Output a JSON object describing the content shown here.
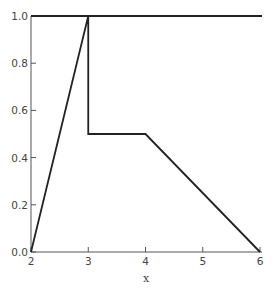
{
  "chart_data": {
    "type": "line",
    "title": "",
    "xlabel": "x",
    "ylabel": "",
    "xlim": [
      2,
      6
    ],
    "ylim": [
      0,
      1
    ],
    "grid": false,
    "legend": null,
    "x_ticks": [
      "2",
      "3",
      "4",
      "5",
      "6"
    ],
    "y_ticks": [
      "0.0",
      "0.2",
      "0.4",
      "0.6",
      "0.8",
      "1.0"
    ],
    "series": [
      {
        "name": "constant line",
        "x": [
          2,
          6
        ],
        "y": [
          1.0,
          1.0
        ]
      },
      {
        "name": "piecewise line",
        "x": [
          2,
          3,
          3,
          4,
          6
        ],
        "y": [
          0.0,
          1.0,
          0.5,
          0.5,
          0.0
        ]
      }
    ]
  }
}
